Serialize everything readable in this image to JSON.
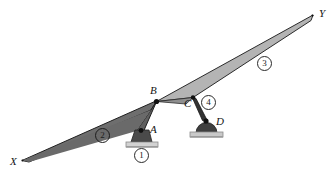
{
  "figure": {
    "background_color": "#ffffff",
    "width": 332,
    "height": 179,
    "point_labels": {
      "x_end": "X",
      "y_end": "Y",
      "joint_a": "A",
      "joint_b": "B",
      "joint_c": "C",
      "joint_d": "D"
    },
    "member_labels": {
      "ground": "1",
      "left_link": "2",
      "right_link": "3",
      "short_link": "4"
    },
    "colors": {
      "left_link_fill": "#6e6e6e",
      "left_link_stroke": "#1f1f1f",
      "right_link_fill": "#b4b4b4",
      "right_link_stroke": "#2b2b2b",
      "short_link_fill": "#333333",
      "support_body": "#4a4a4a",
      "support_body_dark": "#2e2e2e",
      "support_base": "#cfcfcf",
      "support_base_edge": "#8a8a8a",
      "joint_dot": "#111111",
      "label_text": "#141414"
    },
    "geometry": {
      "x_apex": [
        22,
        160
      ],
      "b_joint": [
        156,
        101
      ],
      "a_joint": [
        141,
        130
      ],
      "c_joint": [
        193,
        97
      ],
      "d_joint": [
        205,
        120
      ],
      "y_apex": [
        313,
        15
      ]
    }
  }
}
